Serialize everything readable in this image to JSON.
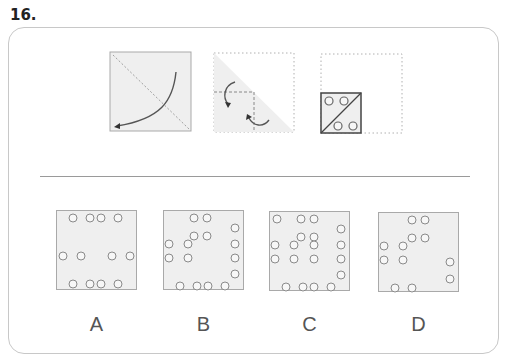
{
  "question": {
    "number": "16."
  },
  "prompt_figures": [
    {
      "name": "fold-diagonal",
      "description": "square with diagonal dotted fold line and curved arrow"
    },
    {
      "name": "fold-triangle",
      "description": "triangle with dashed fold lines and two curved arrows"
    },
    {
      "name": "punched-result",
      "description": "small folded square with diagonal and four holes"
    }
  ],
  "options": [
    {
      "label": "A",
      "dots": [
        [
          16,
          7
        ],
        [
          33,
          7
        ],
        [
          44,
          7
        ],
        [
          61,
          7
        ],
        [
          6,
          45
        ],
        [
          24,
          45
        ],
        [
          55,
          45
        ],
        [
          73,
          45
        ],
        [
          16,
          73
        ],
        [
          33,
          73
        ],
        [
          44,
          73
        ],
        [
          61,
          73
        ]
      ]
    },
    {
      "label": "B",
      "dots": [
        [
          30,
          7
        ],
        [
          43,
          7
        ],
        [
          71,
          17
        ],
        [
          30,
          25
        ],
        [
          43,
          25
        ],
        [
          5,
          33
        ],
        [
          24,
          33
        ],
        [
          5,
          47
        ],
        [
          24,
          47
        ],
        [
          71,
          33
        ],
        [
          71,
          47
        ],
        [
          71,
          63
        ],
        [
          16,
          75
        ],
        [
          33,
          75
        ],
        [
          44,
          75
        ],
        [
          61,
          75
        ]
      ]
    },
    {
      "label": "C",
      "dots": [
        [
          7,
          7
        ],
        [
          31,
          7
        ],
        [
          44,
          7
        ],
        [
          71,
          17
        ],
        [
          31,
          25
        ],
        [
          44,
          25
        ],
        [
          5,
          33
        ],
        [
          24,
          33
        ],
        [
          44,
          33
        ],
        [
          71,
          33
        ],
        [
          5,
          47
        ],
        [
          24,
          47
        ],
        [
          44,
          47
        ],
        [
          71,
          47
        ],
        [
          71,
          63
        ],
        [
          16,
          75
        ],
        [
          33,
          75
        ],
        [
          44,
          75
        ],
        [
          61,
          75
        ]
      ]
    },
    {
      "label": "D",
      "dots": [
        [
          33,
          7
        ],
        [
          46,
          7
        ],
        [
          33,
          25
        ],
        [
          46,
          25
        ],
        [
          5,
          33
        ],
        [
          24,
          33
        ],
        [
          5,
          47
        ],
        [
          24,
          47
        ],
        [
          71,
          49
        ],
        [
          71,
          66
        ],
        [
          16,
          75
        ],
        [
          33,
          75
        ]
      ]
    }
  ],
  "colors": {
    "panel_fill": "#efefef",
    "panel_border": "#a9a9a9",
    "hole_stroke": "#8a8a8a",
    "frame_border": "#c8c8c8"
  }
}
